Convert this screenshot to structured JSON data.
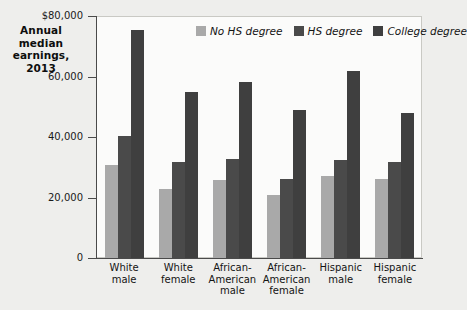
{
  "chart_data": {
    "type": "bar",
    "title_lines": [
      "Annual",
      "median",
      "earnings,",
      "2013"
    ],
    "xlabel": "",
    "ylabel": "Annual median earnings, 2013",
    "ylim": [
      0,
      80000
    ],
    "yticks": [
      0,
      20000,
      40000,
      60000,
      80000
    ],
    "ytick_labels": [
      "0",
      "20,000",
      "40,000",
      "60,000",
      "$80,000"
    ],
    "grid": false,
    "legend_position": "top-right",
    "categories": [
      "White male",
      "White female",
      "African-American male",
      "African-American female",
      "Hispanic male",
      "Hispanic female"
    ],
    "category_lines": [
      [
        "White",
        "male"
      ],
      [
        "White",
        "female"
      ],
      [
        "African-",
        "American",
        "male"
      ],
      [
        "African-",
        "American",
        "female"
      ],
      [
        "Hispanic",
        "male"
      ],
      [
        "Hispanic",
        "female"
      ]
    ],
    "series": [
      {
        "name": "No HS degree",
        "color": "#a9a9a9",
        "values": [
          30800,
          22800,
          25800,
          20700,
          27100,
          26100
        ]
      },
      {
        "name": "HS degree",
        "color": "#4a4a4a",
        "values": [
          40300,
          31800,
          32600,
          26100,
          32500,
          31800
        ]
      },
      {
        "name": "College degree",
        "color": "#3f3f3f",
        "values": [
          75500,
          54800,
          58300,
          48900,
          61800,
          47800
        ]
      }
    ]
  },
  "colors": {
    "background": "#eeeeec",
    "plot_background": "#fbfbfa",
    "axis": "#4a4a4a",
    "frame": "#c9c9c4",
    "text": "#141414",
    "series_no_hs": "#a9a9a9",
    "series_hs": "#4a4a4a",
    "series_college": "#3f3f3f"
  }
}
